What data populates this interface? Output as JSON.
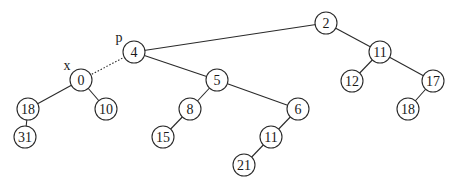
{
  "diagram": {
    "type": "binary-tree",
    "node_radius": 11,
    "colors": {
      "stroke": "#2a2a2a",
      "fill": "#ffffff",
      "text": "#1a1a1a"
    },
    "nodes": [
      {
        "id": "n2",
        "label": "2",
        "x": 326,
        "y": 23
      },
      {
        "id": "n4",
        "label": "4",
        "x": 134,
        "y": 52
      },
      {
        "id": "n11a",
        "label": "11",
        "x": 380,
        "y": 52
      },
      {
        "id": "n0",
        "label": "0",
        "x": 81,
        "y": 80
      },
      {
        "id": "n5",
        "label": "5",
        "x": 217,
        "y": 80
      },
      {
        "id": "n12",
        "label": "12",
        "x": 352,
        "y": 81
      },
      {
        "id": "n17",
        "label": "17",
        "x": 433,
        "y": 81
      },
      {
        "id": "n18a",
        "label": "18",
        "x": 28,
        "y": 109
      },
      {
        "id": "n10",
        "label": "10",
        "x": 106,
        "y": 109
      },
      {
        "id": "n8",
        "label": "8",
        "x": 190,
        "y": 109
      },
      {
        "id": "n6",
        "label": "6",
        "x": 298,
        "y": 109
      },
      {
        "id": "n18b",
        "label": "18",
        "x": 408,
        "y": 109
      },
      {
        "id": "n31",
        "label": "31",
        "x": 25,
        "y": 137
      },
      {
        "id": "n15",
        "label": "15",
        "x": 163,
        "y": 137
      },
      {
        "id": "n11b",
        "label": "11",
        "x": 271,
        "y": 137
      },
      {
        "id": "n21",
        "label": "21",
        "x": 244,
        "y": 165
      }
    ],
    "edges": [
      {
        "from": "n2",
        "to": "n4",
        "style": "solid"
      },
      {
        "from": "n2",
        "to": "n11a",
        "style": "solid"
      },
      {
        "from": "n4",
        "to": "n0",
        "style": "dotted"
      },
      {
        "from": "n4",
        "to": "n5",
        "style": "solid"
      },
      {
        "from": "n11a",
        "to": "n12",
        "style": "solid"
      },
      {
        "from": "n11a",
        "to": "n17",
        "style": "solid"
      },
      {
        "from": "n0",
        "to": "n18a",
        "style": "solid"
      },
      {
        "from": "n0",
        "to": "n10",
        "style": "solid"
      },
      {
        "from": "n5",
        "to": "n8",
        "style": "solid"
      },
      {
        "from": "n5",
        "to": "n6",
        "style": "solid"
      },
      {
        "from": "n17",
        "to": "n18b",
        "style": "solid"
      },
      {
        "from": "n18a",
        "to": "n31",
        "style": "solid"
      },
      {
        "from": "n8",
        "to": "n15",
        "style": "solid"
      },
      {
        "from": "n6",
        "to": "n11b",
        "style": "solid"
      },
      {
        "from": "n11b",
        "to": "n21",
        "style": "solid"
      }
    ],
    "pointer_labels": [
      {
        "id": "p",
        "label": "p",
        "x": 119,
        "y": 37,
        "points_to": "n4"
      },
      {
        "id": "x",
        "label": "x",
        "x": 67,
        "y": 65,
        "points_to": "n0"
      }
    ]
  }
}
